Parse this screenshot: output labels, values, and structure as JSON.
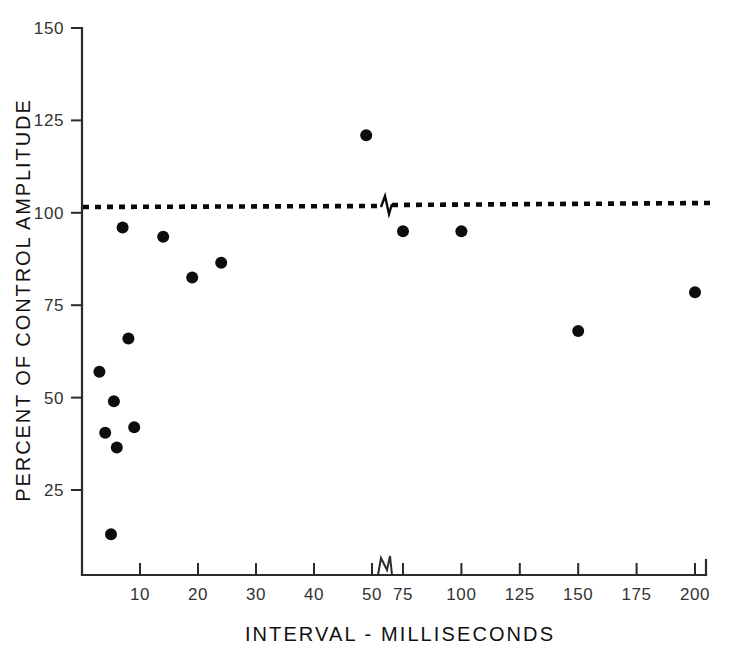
{
  "figure": {
    "background_color": "#ffffff",
    "ink_color": "#111111"
  },
  "chart_data": {
    "type": "scatter",
    "title": "",
    "xlabel": "INTERVAL - MILLISECONDS",
    "ylabel": "PERCENT OF CONTROL AMPLITUDE",
    "xlim": [
      0,
      200
    ],
    "ylim": [
      0,
      150
    ],
    "grid": false,
    "legend": null,
    "x_tick_labels": [
      "10",
      "20",
      "30",
      "40",
      "50",
      "75",
      "100",
      "125",
      "150",
      "175",
      "200"
    ],
    "x_tick_values": [
      10,
      20,
      30,
      40,
      50,
      75,
      100,
      125,
      150,
      175,
      200
    ],
    "y_tick_labels": [
      "25",
      "50",
      "75",
      "100",
      "125",
      "150"
    ],
    "y_tick_values": [
      25,
      50,
      75,
      100,
      125,
      150
    ],
    "axis_break": {
      "axis": "x",
      "between": [
        50,
        75
      ],
      "style": "zigzag"
    },
    "reference_line": {
      "label": "100 percent of control",
      "y": 101,
      "style": "dotted",
      "color": "#0a0a0a",
      "has_break": true
    },
    "marker": {
      "shape": "circle",
      "color": "#0d0d0d",
      "size": 11
    },
    "points": [
      {
        "x": 3,
        "y": 57
      },
      {
        "x": 4,
        "y": 40.5
      },
      {
        "x": 5,
        "y": 13
      },
      {
        "x": 5.5,
        "y": 49
      },
      {
        "x": 6,
        "y": 36.5
      },
      {
        "x": 7,
        "y": 96
      },
      {
        "x": 8,
        "y": 66
      },
      {
        "x": 9,
        "y": 42
      },
      {
        "x": 14,
        "y": 93.5
      },
      {
        "x": 19,
        "y": 82.5
      },
      {
        "x": 24,
        "y": 86.5
      },
      {
        "x": 49,
        "y": 121
      },
      {
        "x": 75,
        "y": 95
      },
      {
        "x": 100,
        "y": 95
      },
      {
        "x": 150,
        "y": 68
      },
      {
        "x": 200,
        "y": 78.5
      }
    ]
  }
}
